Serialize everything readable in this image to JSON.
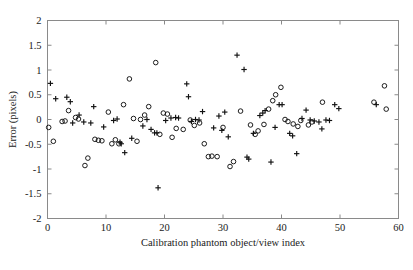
{
  "chart_data": {
    "type": "scatter",
    "title": "",
    "xlabel": "Calibration phantom object/view index",
    "ylabel": "Error (pixels)",
    "xlim": [
      0,
      60
    ],
    "ylim": [
      -2,
      2
    ],
    "xticks": [
      0,
      10,
      20,
      30,
      40,
      50,
      60
    ],
    "xtick_labels": [
      "0",
      "10",
      "20",
      "30",
      "40",
      "50",
      "60"
    ],
    "yticks": [
      -2,
      -1.5,
      -1,
      -0.5,
      0,
      0.5,
      1,
      1.5,
      2
    ],
    "ytick_labels": [
      "-2",
      "-1.5",
      "-1",
      "-0.5",
      "0",
      "0.5",
      "1",
      "1.5",
      "2"
    ],
    "grid": false,
    "legend": null,
    "series": [
      {
        "name": "cross-series",
        "marker": "plus",
        "color": "#111111",
        "points": [
          [
            0.5,
            0.73
          ],
          [
            1.4,
            0.42
          ],
          [
            3.3,
            0.45
          ],
          [
            3.9,
            0.36
          ],
          [
            4.3,
            -0.07
          ],
          [
            5.4,
            0.09
          ],
          [
            6.2,
            -0.05
          ],
          [
            7.4,
            -0.07
          ],
          [
            7.9,
            0.26
          ],
          [
            9.6,
            -0.15
          ],
          [
            11.3,
            -0.02
          ],
          [
            11.9,
            0.01
          ],
          [
            12.4,
            -0.46
          ],
          [
            12.6,
            -0.49
          ],
          [
            13.2,
            -0.67
          ],
          [
            14.4,
            -0.38
          ],
          [
            16.3,
            -0.13
          ],
          [
            17.0,
            0.0
          ],
          [
            17.7,
            -0.2
          ],
          [
            18.3,
            -0.27
          ],
          [
            18.9,
            -1.38
          ],
          [
            18.7,
            -0.27
          ],
          [
            20.2,
            -0.02
          ],
          [
            21.1,
            0.03
          ],
          [
            21.9,
            0.04
          ],
          [
            22.4,
            0.03
          ],
          [
            23.8,
            0.72
          ],
          [
            24.1,
            0.46
          ],
          [
            24.6,
            -0.04
          ],
          [
            25.3,
            0.0
          ],
          [
            25.9,
            -0.01
          ],
          [
            26.5,
            0.16
          ],
          [
            28.4,
            -0.17
          ],
          [
            29.3,
            0.07
          ],
          [
            29.8,
            -0.22
          ],
          [
            30.3,
            0.15
          ],
          [
            30.9,
            -0.35
          ],
          [
            32.4,
            1.3
          ],
          [
            33.6,
            1.01
          ],
          [
            34.1,
            -0.76
          ],
          [
            34.4,
            -0.8
          ],
          [
            35.2,
            -0.28
          ],
          [
            36.3,
            0.08
          ],
          [
            36.8,
            0.13
          ],
          [
            37.2,
            0.18
          ],
          [
            38.2,
            -0.86
          ],
          [
            38.9,
            -0.16
          ],
          [
            39.6,
            0.3
          ],
          [
            40.1,
            0.3
          ],
          [
            41.4,
            -0.28
          ],
          [
            41.9,
            -0.33
          ],
          [
            42.6,
            -0.69
          ],
          [
            43.5,
            0.02
          ],
          [
            44.2,
            0.19
          ],
          [
            44.9,
            -0.01
          ],
          [
            45.6,
            -0.03
          ],
          [
            46.4,
            -0.05
          ],
          [
            46.9,
            -0.19
          ],
          [
            47.6,
            -0.01
          ],
          [
            48.2,
            -0.02
          ],
          [
            49.1,
            0.3
          ],
          [
            49.8,
            0.22
          ],
          [
            56.2,
            0.3
          ]
        ]
      },
      {
        "name": "circle-series",
        "marker": "circle",
        "color": "#111111",
        "points": [
          [
            0.2,
            -0.16
          ],
          [
            1.0,
            -0.44
          ],
          [
            2.5,
            -0.04
          ],
          [
            3.0,
            -0.03
          ],
          [
            3.6,
            0.18
          ],
          [
            4.8,
            0.04
          ],
          [
            5.3,
            0.01
          ],
          [
            6.4,
            -0.93
          ],
          [
            6.9,
            -0.78
          ],
          [
            8.1,
            -0.4
          ],
          [
            8.7,
            -0.42
          ],
          [
            9.3,
            -0.43
          ],
          [
            10.4,
            0.15
          ],
          [
            11.0,
            -0.49
          ],
          [
            11.6,
            -0.41
          ],
          [
            12.2,
            -0.49
          ],
          [
            13.0,
            0.3
          ],
          [
            14.0,
            0.82
          ],
          [
            14.7,
            0.02
          ],
          [
            15.3,
            -0.44
          ],
          [
            15.9,
            0.0
          ],
          [
            16.6,
            0.09
          ],
          [
            17.3,
            0.26
          ],
          [
            18.5,
            1.15
          ],
          [
            19.2,
            -0.3
          ],
          [
            19.8,
            0.13
          ],
          [
            20.5,
            0.11
          ],
          [
            21.3,
            -0.36
          ],
          [
            22.0,
            -0.18
          ],
          [
            23.2,
            -0.2
          ],
          [
            24.4,
            -0.01
          ],
          [
            25.1,
            -0.12
          ],
          [
            26.0,
            -0.07
          ],
          [
            26.8,
            -0.49
          ],
          [
            27.5,
            -0.75
          ],
          [
            28.1,
            -0.74
          ],
          [
            29.0,
            -0.75
          ],
          [
            30.0,
            -0.16
          ],
          [
            31.2,
            -0.95
          ],
          [
            31.8,
            -0.85
          ],
          [
            33.0,
            0.17
          ],
          [
            34.7,
            -0.11
          ],
          [
            35.5,
            -0.3
          ],
          [
            36.0,
            -0.23
          ],
          [
            37.0,
            -0.1
          ],
          [
            37.8,
            0.21
          ],
          [
            38.5,
            0.38
          ],
          [
            39.0,
            0.5
          ],
          [
            39.9,
            0.65
          ],
          [
            40.6,
            0.0
          ],
          [
            41.1,
            -0.04
          ],
          [
            42.0,
            -0.09
          ],
          [
            42.8,
            -0.14
          ],
          [
            43.3,
            -0.02
          ],
          [
            44.6,
            -0.11
          ],
          [
            45.2,
            -0.05
          ],
          [
            47.0,
            0.35
          ],
          [
            55.8,
            0.35
          ],
          [
            57.6,
            0.68
          ],
          [
            57.9,
            0.21
          ]
        ]
      }
    ]
  },
  "axis": {
    "x_title": "Calibration phantom object/view index",
    "y_title": "Error (pixels)"
  }
}
